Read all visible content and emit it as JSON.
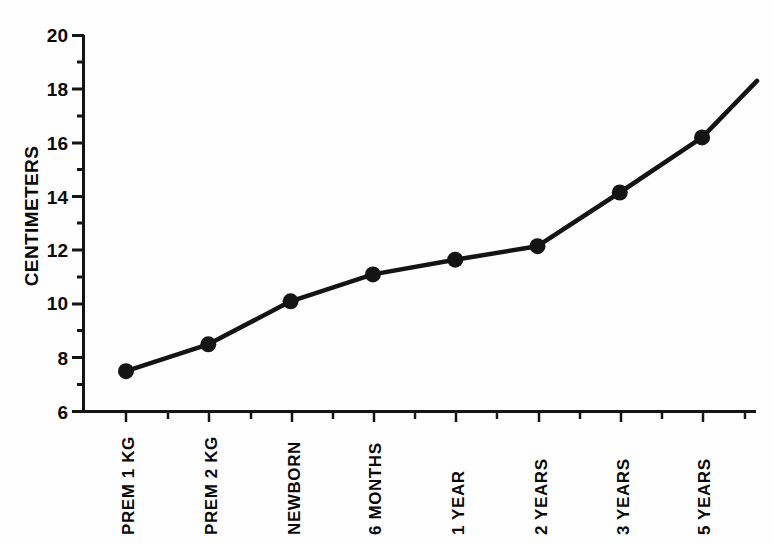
{
  "chart_data": {
    "type": "line",
    "title": "",
    "xlabel": "",
    "ylabel": "CENTIMETERS",
    "categories": [
      "PREM 1 KG",
      "PREM 2 KG",
      "NEWBORN",
      "6 MONTHS",
      "1 YEAR",
      "2 YEARS",
      "3 YEARS",
      "5 YEARS"
    ],
    "values": [
      7.5,
      8.5,
      10.1,
      11.1,
      11.65,
      12.15,
      14.15,
      16.2
    ],
    "series": [
      {
        "name": "CENTIMETERS",
        "values": [
          7.5,
          8.5,
          10.1,
          11.1,
          11.65,
          12.15,
          14.15,
          16.2
        ]
      }
    ],
    "ylim": [
      6,
      20
    ],
    "y_ticks": [
      6,
      8,
      10,
      12,
      14,
      16,
      18,
      20
    ],
    "y_minor_ticks": [
      7,
      9,
      11,
      13,
      15,
      17,
      19
    ],
    "y_tick_labels": [
      "6",
      "8",
      "10",
      "12",
      "14",
      "16",
      "18",
      "20"
    ],
    "grid": false,
    "legend": "none",
    "marker": "filled-circle",
    "line_color": "#141414",
    "marker_color": "#141414",
    "axis_color": "#141414",
    "background_color": "#fefefe",
    "line_extends_past_last_point": true,
    "extension_end_value": 18.3
  },
  "axes": {
    "y_title": "CENTIMETERS",
    "x_tick_count": 9,
    "y_range_label_top": "20",
    "y_range_label_bottom": "6"
  }
}
